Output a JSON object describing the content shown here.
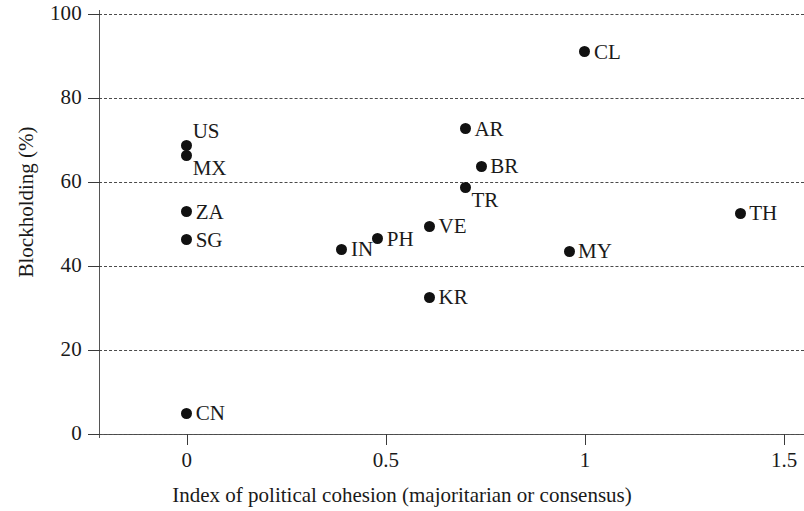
{
  "chart_data": {
    "type": "scatter",
    "title": "",
    "xlabel": "Index of political cohesion (majoritarian or consensus)",
    "ylabel": "Blockholding (%)",
    "xlim": [
      -0.22,
      1.55
    ],
    "ylim": [
      0,
      100
    ],
    "xticks": [
      0,
      0.5,
      1,
      1.5
    ],
    "xtick_labels": [
      "0",
      "0.5",
      "1",
      "1.5"
    ],
    "yticks": [
      0,
      20,
      40,
      60,
      80,
      100
    ],
    "ytick_labels": [
      "0",
      "20",
      "40",
      "60",
      "80",
      "100"
    ],
    "grid": "horizontal-dashed",
    "legend": "none",
    "marker_color": "#111111",
    "points": [
      {
        "label": "CN",
        "x": 0.0,
        "y": 5.0,
        "label_pos": "right"
      },
      {
        "label": "SG",
        "x": 0.0,
        "y": 46.2,
        "label_pos": "right"
      },
      {
        "label": "ZA",
        "x": 0.0,
        "y": 52.9,
        "label_pos": "right"
      },
      {
        "label": "MX",
        "x": 0.0,
        "y": 66.2,
        "label_pos": "lower-right"
      },
      {
        "label": "US",
        "x": 0.0,
        "y": 68.8,
        "label_pos": "upper-right"
      },
      {
        "label": "IN",
        "x": 0.39,
        "y": 44.0,
        "label_pos": "right"
      },
      {
        "label": "PH",
        "x": 0.48,
        "y": 46.5,
        "label_pos": "right"
      },
      {
        "label": "KR",
        "x": 0.61,
        "y": 32.6,
        "label_pos": "right"
      },
      {
        "label": "VE",
        "x": 0.61,
        "y": 49.5,
        "label_pos": "right"
      },
      {
        "label": "TR",
        "x": 0.7,
        "y": 58.6,
        "label_pos": "lower-right"
      },
      {
        "label": "AR",
        "x": 0.7,
        "y": 72.7,
        "label_pos": "right"
      },
      {
        "label": "BR",
        "x": 0.74,
        "y": 63.8,
        "label_pos": "right"
      },
      {
        "label": "MY",
        "x": 0.96,
        "y": 43.5,
        "label_pos": "right"
      },
      {
        "label": "CL",
        "x": 1.0,
        "y": 91.0,
        "label_pos": "right"
      },
      {
        "label": "TH",
        "x": 1.39,
        "y": 52.6,
        "label_pos": "right"
      }
    ]
  }
}
